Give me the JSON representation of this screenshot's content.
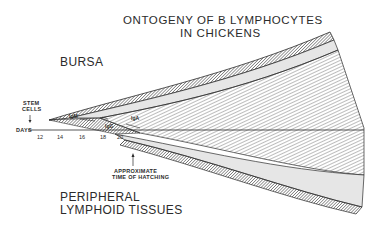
{
  "title": {
    "line1": "ONTOGENY OF B LYMPHOCYTES",
    "line2": "IN CHICKENS"
  },
  "regions": {
    "upper": "BURSA",
    "lower_line1": "PERIPHERAL",
    "lower_line2": "LYMPHOID TISSUES"
  },
  "annotations": {
    "stem_cells_line1": "STEM",
    "stem_cells_line2": "CELLS",
    "hatching_line1": "APPROXIMATE",
    "hatching_line2": "TIME OF HATCHING"
  },
  "axis": {
    "label": "DAYS",
    "ticks": [
      "12",
      "14",
      "16",
      "18",
      "20"
    ]
  },
  "classes": {
    "igm": "IgM",
    "igg": "IgG",
    "iga": "IgA"
  },
  "colors": {
    "ink": "#2b2b2b",
    "hatch": "#6a6a6a",
    "band": "#e6e6e6",
    "background": "#ffffff"
  }
}
